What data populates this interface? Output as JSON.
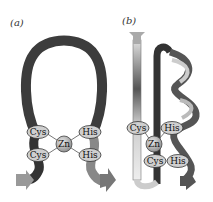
{
  "panels": [
    {
      "label": "(a)",
      "residues": {
        "cys1": "Cys",
        "cys2": "Cys",
        "his1": "His",
        "his2": "His"
      },
      "metal": "Zn"
    },
    {
      "label": "(b)",
      "residues": {
        "cys1": "Cys",
        "cys2": "Cys",
        "his1": "His",
        "his2": "His"
      },
      "metal": "Zn"
    }
  ],
  "colors": {
    "ribbon_dark": "#3a3a3a",
    "ribbon_mid": "#8a8a8a",
    "ribbon_light": "#dcdcdc",
    "residue_fill": "#c8c8c8",
    "zn_fill": "#b8b8b8"
  }
}
